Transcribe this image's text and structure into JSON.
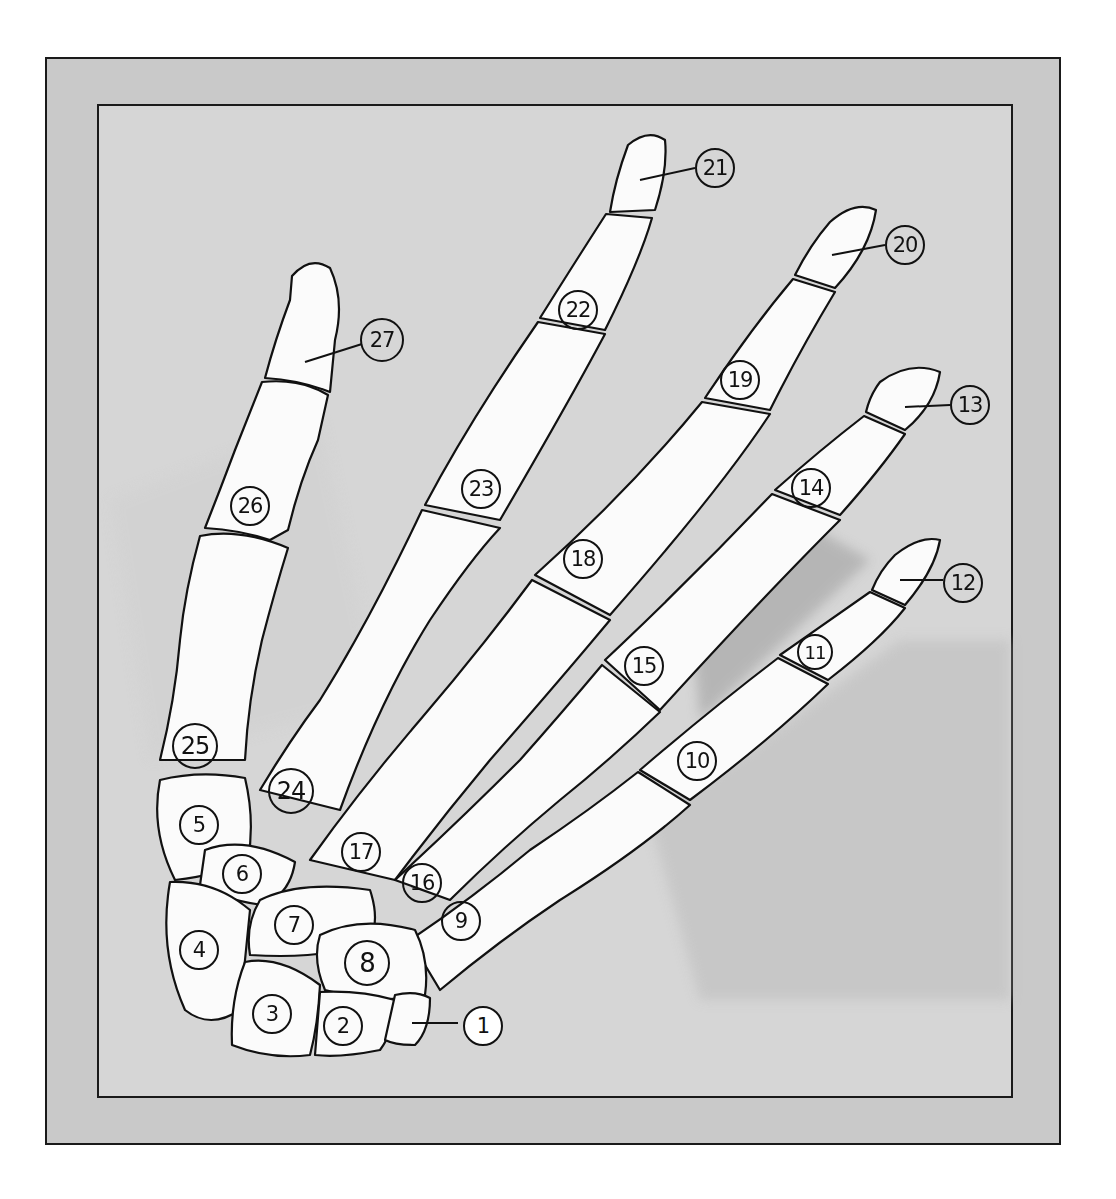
{
  "diagram": {
    "colors": {
      "frame_outer": "#c9c9c9",
      "frame_inner": "#d6d6d6",
      "bone": "#fbfbfb",
      "shadow": "#b9b9b9",
      "ink": "#111111"
    },
    "labels": [
      {
        "num": "1",
        "x": 1013,
        "y": 1026,
        "leader": true
      },
      {
        "num": "2",
        "x": 343,
        "y": 1026
      },
      {
        "num": "3",
        "x": 272,
        "y": 1014
      },
      {
        "num": "4",
        "x": 199,
        "y": 950
      },
      {
        "num": "5",
        "x": 199,
        "y": 825
      },
      {
        "num": "6",
        "x": 242,
        "y": 874
      },
      {
        "num": "7",
        "x": 294,
        "y": 925
      },
      {
        "num": "8",
        "x": 367,
        "y": 963
      },
      {
        "num": "9",
        "x": 461,
        "y": 921
      },
      {
        "num": "10",
        "x": 697,
        "y": 761
      },
      {
        "num": "11",
        "x": 815,
        "y": 652
      },
      {
        "num": "12",
        "x": 963,
        "y": 583,
        "leader": true
      },
      {
        "num": "13",
        "x": 970,
        "y": 405,
        "leader": true
      },
      {
        "num": "14",
        "x": 811,
        "y": 488
      },
      {
        "num": "15",
        "x": 644,
        "y": 666
      },
      {
        "num": "16",
        "x": 422,
        "y": 883
      },
      {
        "num": "17",
        "x": 361,
        "y": 852
      },
      {
        "num": "18",
        "x": 583,
        "y": 559
      },
      {
        "num": "19",
        "x": 740,
        "y": 380
      },
      {
        "num": "20",
        "x": 905,
        "y": 245,
        "leader": true
      },
      {
        "num": "21",
        "x": 715,
        "y": 168,
        "leader": true
      },
      {
        "num": "22",
        "x": 578,
        "y": 310
      },
      {
        "num": "23",
        "x": 481,
        "y": 489
      },
      {
        "num": "24",
        "x": 291,
        "y": 791
      },
      {
        "num": "25",
        "x": 195,
        "y": 746
      },
      {
        "num": "26",
        "x": 250,
        "y": 506
      },
      {
        "num": "27",
        "x": 382,
        "y": 340,
        "leader": true
      }
    ]
  }
}
